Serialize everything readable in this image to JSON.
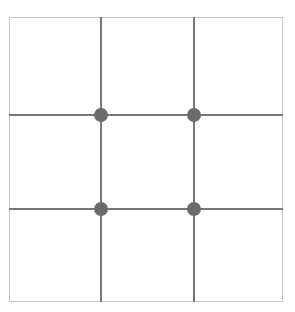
{
  "diagram": {
    "grid": {
      "rows": 3,
      "cols": 3
    },
    "colors": {
      "frame": "#c4c4c4",
      "lines": "#777777",
      "dots": "#6b6b6b",
      "background": "#ffffff"
    },
    "intersections": [
      {
        "row": 1,
        "col": 1
      },
      {
        "row": 1,
        "col": 2
      },
      {
        "row": 2,
        "col": 1
      },
      {
        "row": 2,
        "col": 2
      }
    ]
  }
}
